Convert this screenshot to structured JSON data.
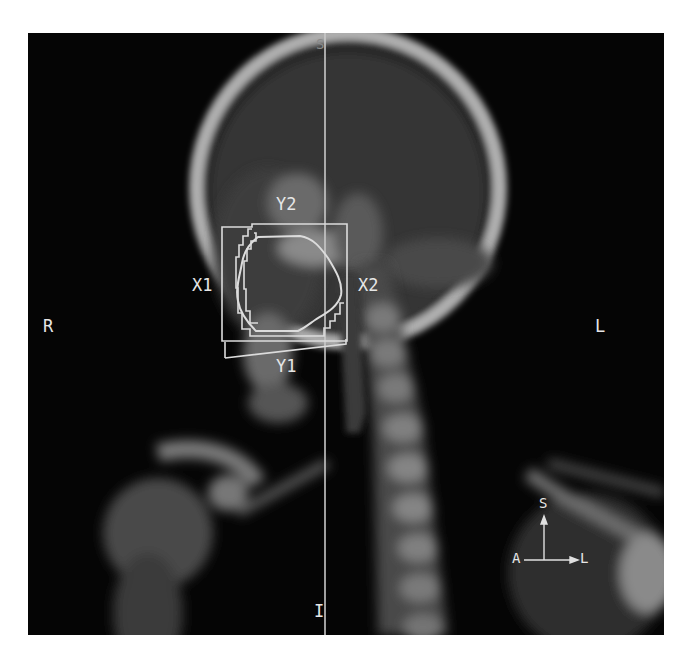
{
  "image": {
    "type": "DRR lateral head and neck radiograph",
    "background_color": "#050505",
    "overlay_color": "#d8d8d8"
  },
  "orientation_labels": {
    "superior": "S",
    "inferior": "I",
    "right": "R",
    "left": "L"
  },
  "field_jaw_labels": {
    "x1": "X1",
    "x2": "X2",
    "y1": "Y1",
    "y2": "Y2"
  },
  "orientation_marker": {
    "up": "S",
    "left": "A",
    "right": "L"
  }
}
